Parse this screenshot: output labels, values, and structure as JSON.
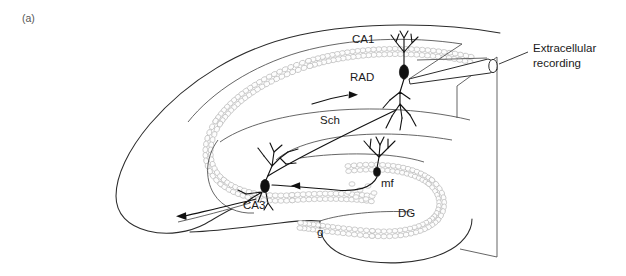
{
  "figure": {
    "panel_label": "(a)"
  },
  "labels": {
    "ca1": "CA1",
    "rad": "RAD",
    "sch": "Sch",
    "ca3": "CA3",
    "mf": "mf",
    "dg": "DG",
    "g": "g",
    "electrode_line1": "Extracellular",
    "electrode_line2": "recording"
  },
  "colors": {
    "outline": "#2b2b2b",
    "cell_layer": "#bcbcbc",
    "neuron": "#111111",
    "text": "#1a1a1a",
    "background": "#ffffff"
  },
  "annotations": {
    "sch_arrow_direction": "rightward",
    "mf_arrow_direction": "leftward",
    "output_arrow_direction": "left-downward"
  }
}
